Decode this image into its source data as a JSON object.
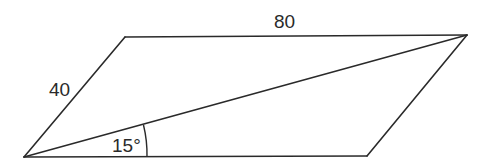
{
  "diagram": {
    "type": "parallelogram-with-diagonal",
    "vertices": {
      "top_left": [
        125,
        37
      ],
      "top_right": [
        467,
        35
      ],
      "bottom_right": [
        367,
        156
      ],
      "bottom_left": [
        24,
        157
      ]
    },
    "labels": {
      "top_side": "80",
      "left_side": "40",
      "angle": "15°"
    },
    "colors": {
      "stroke": "#2a2a2a",
      "background": "#ffffff"
    }
  }
}
